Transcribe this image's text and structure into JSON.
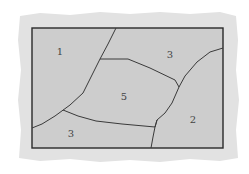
{
  "colors": {
    "background": "#ffffff",
    "mat": "#e2e2e2",
    "map_fill": "#cdcdcd",
    "border": "#2a2a2a",
    "boundary": "#3a3a3a",
    "label": "#444444"
  },
  "map": {
    "frame": {
      "x": 32,
      "y": 28,
      "width": 191,
      "height": 120
    },
    "regions": [
      {
        "id": "region-1",
        "label": "1",
        "x": 60,
        "y": 55
      },
      {
        "id": "region-3-top",
        "label": "3",
        "x": 170,
        "y": 58
      },
      {
        "id": "region-5",
        "label": "5",
        "x": 124,
        "y": 100
      },
      {
        "id": "region-2",
        "label": "2",
        "x": 193,
        "y": 123
      },
      {
        "id": "region-3-bottom",
        "label": "3",
        "x": 71,
        "y": 137
      }
    ],
    "boundaries": [
      {
        "id": "boundary-1-5",
        "points": "116,28 108,44 100,59 92,75 83,93 70,105 55,116 42,124 32,128"
      },
      {
        "id": "boundary-5-3top",
        "points": "100,59 128,59 150,68 175,80 179,87"
      },
      {
        "id": "boundary-3top-2",
        "points": "223,48 210,52 197,62 185,76 179,87 172,103 165,113 157,120"
      },
      {
        "id": "boundary-5-3bottom",
        "points": "63,110 78,116 96,121 122,124 155,127 157,120"
      },
      {
        "id": "boundary-3bottom-2",
        "points": "157,120 155,127 153,137 151,148"
      }
    ]
  }
}
